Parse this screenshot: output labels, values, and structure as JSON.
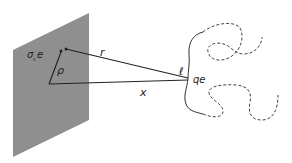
{
  "diagram": {
    "plane": {
      "color": "#8f8f8f",
      "label_sigma": "σ",
      "label_sub": "s",
      "label_e": "e"
    },
    "labels": {
      "rho": "ρ",
      "r": "r",
      "x": "x",
      "ell": "ℓ",
      "qe": "qe"
    },
    "line_color": "#222222"
  }
}
